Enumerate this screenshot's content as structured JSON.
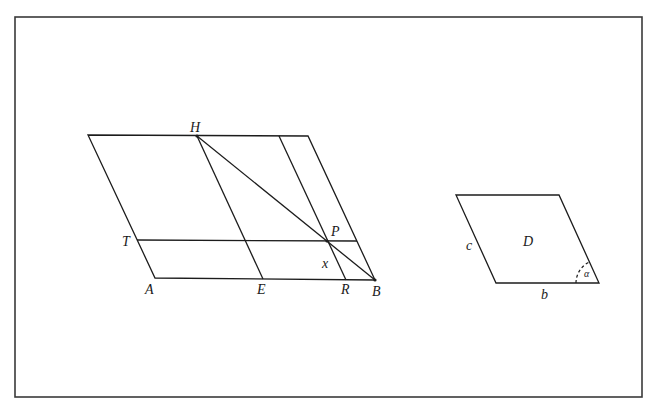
{
  "figure": {
    "frame": {
      "x": 15,
      "y": 17,
      "w": 627,
      "h": 380
    },
    "left_figure": {
      "description": "Parallelogram with transversal lines and diagonal HB",
      "points": {
        "TL": [
          88,
          135
        ],
        "TR": [
          308,
          136
        ],
        "A": [
          155,
          278
        ],
        "B": [
          375,
          280
        ],
        "H": [
          197,
          136
        ],
        "E": [
          263,
          279
        ],
        "Q": [
          279,
          136
        ],
        "R": [
          346,
          280
        ],
        "T": [
          137,
          240
        ],
        "TE": [
          357,
          241
        ],
        "P": [
          327,
          242
        ]
      },
      "labels": {
        "H": {
          "text": "H",
          "x": 190,
          "y": 132
        },
        "T": {
          "text": "T",
          "x": 122,
          "y": 246
        },
        "A": {
          "text": "A",
          "x": 145,
          "y": 294
        },
        "E": {
          "text": "E",
          "x": 257,
          "y": 294
        },
        "R": {
          "text": "R",
          "x": 341,
          "y": 294
        },
        "B": {
          "text": "B",
          "x": 372,
          "y": 296
        },
        "P": {
          "text": "P",
          "x": 331,
          "y": 236
        },
        "x": {
          "text": "x",
          "x": 322,
          "y": 268
        }
      }
    },
    "right_figure": {
      "description": "Parallelogram D with sides b, c and angle alpha",
      "points": {
        "TL": [
          456,
          195
        ],
        "TR": [
          559,
          195
        ],
        "BR": [
          599,
          283
        ],
        "BL": [
          496,
          283
        ]
      },
      "labels": {
        "D": {
          "text": "D",
          "x": 523,
          "y": 246
        },
        "c": {
          "text": "c",
          "x": 466,
          "y": 250
        },
        "b": {
          "text": "b",
          "x": 541,
          "y": 299
        },
        "alpha": {
          "text": "α",
          "x": 583,
          "y": 277
        }
      }
    }
  }
}
